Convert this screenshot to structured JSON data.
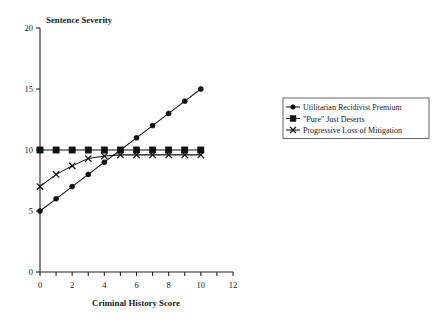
{
  "chart_data": {
    "type": "line",
    "title": "Sentence Severity",
    "xlabel": "Criminal History Score",
    "ylabel": "Sentence Severity",
    "xlim": [
      0,
      12
    ],
    "ylim": [
      0,
      20
    ],
    "grid": false,
    "legend_position": "right",
    "x_ticks": [
      0,
      1,
      2,
      3,
      4,
      5,
      6,
      7,
      8,
      9,
      10,
      11,
      12
    ],
    "x_tick_labels": [
      "0",
      "",
      "2",
      "",
      "4",
      "",
      "6",
      "",
      "8",
      "",
      "10",
      "",
      "12"
    ],
    "y_ticks": [
      0,
      5,
      10,
      15,
      20
    ],
    "y_tick_labels": [
      "0",
      "5",
      "10",
      "15",
      "20"
    ],
    "x": [
      0,
      1,
      2,
      3,
      4,
      5,
      6,
      7,
      8,
      9,
      10
    ],
    "series": [
      {
        "name": "Utilitarian Recidivist Premium",
        "marker": "circle",
        "values": [
          5,
          6,
          7,
          8,
          9,
          10,
          11,
          12,
          13,
          14,
          15
        ]
      },
      {
        "name": "\"Pure\" Just Deserts",
        "marker": "square",
        "values": [
          10,
          10,
          10,
          10,
          10,
          10,
          10,
          10,
          10,
          10,
          10
        ]
      },
      {
        "name": "Progressive Loss of Mitigation",
        "marker": "x",
        "values": [
          7,
          8,
          8.7,
          9.3,
          9.5,
          9.6,
          9.6,
          9.6,
          9.6,
          9.6,
          9.6
        ]
      }
    ]
  },
  "legend": {
    "entries": [
      {
        "label": "Utilitarian Recidivist Premium",
        "marker": "circle"
      },
      {
        "label": "\"Pure\" Just Deserts",
        "marker": "square"
      },
      {
        "label": "Progressive Loss of Mitigation",
        "marker": "x"
      }
    ]
  },
  "colors": {
    "ink": "#111111",
    "axis": "#222222",
    "background": "#ffffff",
    "legend_border": "#555555"
  }
}
